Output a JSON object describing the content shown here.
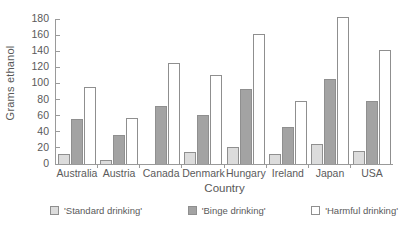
{
  "chart_data": {
    "type": "bar",
    "title": "",
    "xlabel": "Country",
    "ylabel": "Grams ethanol",
    "ylim": [
      0,
      180
    ],
    "ytick_step": 20,
    "yticks": [
      180,
      160,
      140,
      120,
      100,
      80,
      60,
      40,
      20,
      0
    ],
    "grid": false,
    "legend_position": "bottom",
    "categories": [
      "Australia",
      "Austria",
      "Canada",
      "Denmark",
      "Hungary",
      "Ireland",
      "Japan",
      "USA"
    ],
    "series": [
      {
        "name": "'Standard drinking'",
        "color": "#dcdcdc",
        "values": [
          13,
          5,
          0,
          15,
          21,
          13,
          25,
          16
        ]
      },
      {
        "name": "'Binge drinking'",
        "color": "#a3a3a3",
        "values": [
          56,
          36,
          72,
          61,
          93,
          46,
          106,
          78
        ]
      },
      {
        "name": "'Harmful drinking'",
        "color": "#ffffff",
        "values": [
          95,
          57,
          125,
          111,
          161,
          78,
          183,
          142
        ]
      }
    ]
  },
  "legend": {
    "items": [
      {
        "label": "'Standard drinking'",
        "swatch": "standard"
      },
      {
        "label": "'Binge drinking'",
        "swatch": "binge"
      },
      {
        "label": "'Harmful drinking'",
        "swatch": "harmful"
      }
    ]
  },
  "colors": {
    "axis": "#9a9a9a",
    "text": "#5a5a5a",
    "bar_outline": "#8f8f8f",
    "background": "#ffffff"
  }
}
